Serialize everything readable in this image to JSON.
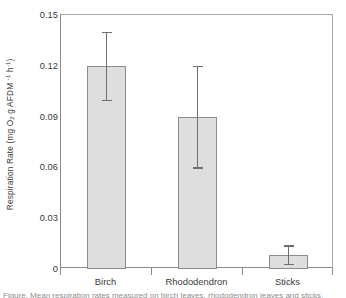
{
  "figure": {
    "background": "#ffffff",
    "frame_color": "#8a8a8a"
  },
  "axis": {
    "y_title_plain": "Respiration Rate (mg O2 g AFDM -1 h-1)",
    "y_title_prefix": "Respiration Rate (mg O",
    "y_title_sub1": "2",
    "y_title_mid": " g AFDM ",
    "y_title_sup1": "-1",
    "y_title_mid2": " h",
    "y_title_sup2": "-1",
    "y_title_suffix": ")",
    "x_title": ""
  },
  "chart_data": {
    "type": "bar",
    "title": "",
    "xlabel": "",
    "ylabel": "Respiration Rate (mg O2 g AFDM-1 h-1)",
    "categories": [
      "Birch",
      "Rhododendron",
      "Sticks"
    ],
    "values": [
      0.12,
      0.09,
      0.008
    ],
    "errors_upper": [
      0.02,
      0.03,
      0.006
    ],
    "errors_lower": [
      0.02,
      0.03,
      0.005
    ],
    "error_upper_abs": [
      0.14,
      0.12,
      0.014
    ],
    "error_lower_abs": [
      0.1,
      0.06,
      0.003
    ],
    "ylim": [
      0,
      0.15
    ],
    "yticks": [
      0,
      0.03,
      0.06,
      0.09,
      0.12,
      0.15
    ],
    "ytick_labels": [
      "0",
      "0.03",
      "0.06",
      "0.09",
      "0.12",
      "0.15"
    ],
    "grid": false,
    "legend": "none",
    "bar_fill": "#dedede",
    "bar_edge": "#8c8c8c",
    "error_color": "#6e6e6e"
  },
  "caption": {
    "clipped_text": "Figure. Mean respiration rates measured on birch leaves, rhododendron leaves and sticks."
  }
}
